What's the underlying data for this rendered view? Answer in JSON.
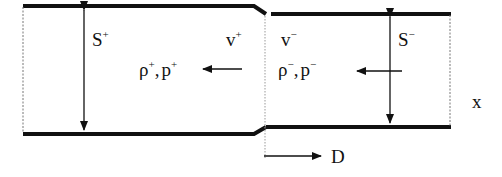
{
  "diagram": {
    "left_region": {
      "area_label": "S",
      "area_sup": "+",
      "velocity_label": "v",
      "velocity_sup": "+",
      "state_rho": "ρ",
      "state_rho_sup": "+",
      "state_sep": ",",
      "state_p": "p",
      "state_p_sup": "+"
    },
    "right_region": {
      "area_label": "S",
      "area_sup": "−",
      "velocity_label": "v",
      "velocity_sup": "−",
      "state_rho": "ρ",
      "state_rho_sup": "−",
      "state_sep": ",",
      "state_p": "p",
      "state_p_sup": "−"
    },
    "axis_label": "x",
    "front_velocity_label": "D",
    "colors": {
      "line": "#111111",
      "dashed": "#777777",
      "background": "#ffffff"
    }
  }
}
